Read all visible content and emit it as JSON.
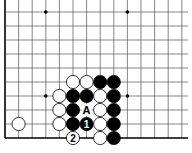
{
  "diagram": {
    "type": "go-board-fragment",
    "grid": {
      "origin_x": 5,
      "origin_y": 12,
      "spacing_x": 13.6,
      "spacing_y": 14,
      "cols": 14,
      "rows": 10,
      "left_edge": true,
      "bottom_edge": true,
      "line_color": "#555555",
      "edge_color": "#000000"
    },
    "hoshi": [
      {
        "col": 3,
        "row": 0
      },
      {
        "col": 9,
        "row": 0
      },
      {
        "col": 3,
        "row": 6
      },
      {
        "col": 9,
        "row": 6
      }
    ],
    "stones": [
      {
        "color": "white",
        "col": 5,
        "row": 5
      },
      {
        "color": "white",
        "col": 6,
        "row": 5
      },
      {
        "color": "black",
        "col": 7,
        "row": 5
      },
      {
        "color": "black",
        "col": 8,
        "row": 5
      },
      {
        "color": "white",
        "col": 4,
        "row": 6
      },
      {
        "color": "black",
        "col": 5,
        "row": 6
      },
      {
        "color": "black",
        "col": 6,
        "row": 6
      },
      {
        "color": "white",
        "col": 7,
        "row": 6
      },
      {
        "color": "black",
        "col": 8,
        "row": 6
      },
      {
        "color": "white",
        "col": 4,
        "row": 7
      },
      {
        "color": "black",
        "col": 5,
        "row": 7
      },
      {
        "color": "white",
        "col": 7,
        "row": 7
      },
      {
        "color": "black",
        "col": 8,
        "row": 7
      },
      {
        "color": "white",
        "col": 1,
        "row": 8
      },
      {
        "color": "white",
        "col": 4,
        "row": 8
      },
      {
        "color": "black",
        "col": 5,
        "row": 8
      },
      {
        "color": "black",
        "col": 6,
        "row": 8,
        "label": "1"
      },
      {
        "color": "white",
        "col": 7,
        "row": 8
      },
      {
        "color": "black",
        "col": 8,
        "row": 8
      },
      {
        "color": "white",
        "col": 5,
        "row": 9,
        "label": "2"
      },
      {
        "color": "white",
        "col": 7,
        "row": 9
      },
      {
        "color": "black",
        "col": 8,
        "row": 9
      }
    ],
    "markers": [
      {
        "col": 6,
        "row": 7,
        "label": "A"
      }
    ]
  }
}
